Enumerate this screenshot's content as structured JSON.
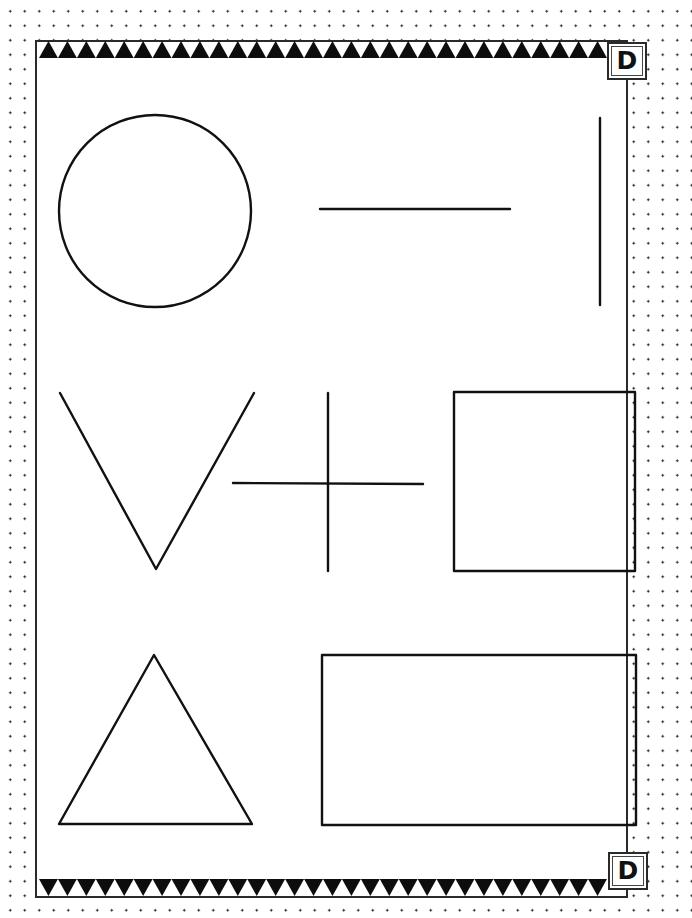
{
  "worksheet": {
    "corner_letter_top": "D",
    "corner_letter_bottom": "D",
    "ink_color": "#111111",
    "border_pattern_top": "triangles-up",
    "border_pattern_bottom": "triangles-down",
    "background_pattern": "dotted",
    "shapes": [
      {
        "name": "circle",
        "row": 1,
        "column": 1
      },
      {
        "name": "horizontal-line",
        "row": 1,
        "column": 2
      },
      {
        "name": "vertical-line",
        "row": 1,
        "column": 3
      },
      {
        "name": "v-shape",
        "row": 2,
        "column": 1
      },
      {
        "name": "plus-cross",
        "row": 2,
        "column": 2
      },
      {
        "name": "square",
        "row": 2,
        "column": 3
      },
      {
        "name": "triangle",
        "row": 3,
        "column": 1
      },
      {
        "name": "rectangle",
        "row": 3,
        "column": 2
      }
    ]
  }
}
